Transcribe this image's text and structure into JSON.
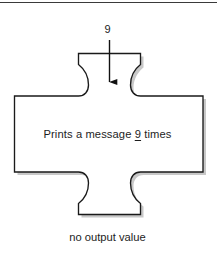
{
  "diagram": {
    "type": "function-block-puzzle-piece",
    "top_rule": {
      "name": "page-top-rule",
      "color": "#3a3a3a"
    },
    "input": {
      "value_label": "9",
      "arrow_direction": "down",
      "arrow_color": "#111111"
    },
    "block": {
      "fill_color": "#ffffff",
      "stroke_color": "#1a1a1a",
      "shadow_color": "#9a9a9a",
      "body_text_prefix": "Prints a message ",
      "body_text_count": "9",
      "body_text_suffix": " times",
      "body_text_full": "Prints a message _9_ times"
    },
    "output": {
      "label": "no output value"
    }
  }
}
